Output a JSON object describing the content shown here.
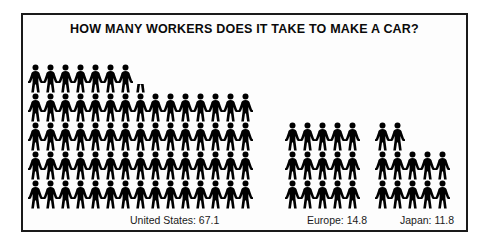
{
  "chart": {
    "title": "HOW MANY WORKERS DOES IT TAKE TO MAKE A CAR?",
    "frame_color": "#1a1a1a",
    "figure_color": "#000000",
    "background": "#ffffff"
  },
  "chart_data": {
    "type": "pictogram",
    "title": "HOW MANY WORKERS DOES IT TAKE TO MAKE A CAR?",
    "xlabel": "",
    "ylabel": "",
    "unit": "1 figure = 1 worker",
    "categories": [
      "United States",
      "Europe",
      "Japan"
    ],
    "values": [
      67.1,
      14.8,
      11.8
    ],
    "value_labels": [
      "67.1",
      "14.8",
      "11.8"
    ],
    "captions": [
      "United States: 67.1",
      "Europe: 14.8",
      "Japan: 11.8"
    ],
    "series": [
      {
        "name": "Workers per car",
        "values": [
          67.1,
          14.8,
          11.8
        ]
      }
    ],
    "groups": [
      {
        "name": "United States",
        "value": 67.1,
        "caption": "United States: 67.1",
        "columns": 15,
        "rows_bottom_to_top": [
          15,
          15,
          15,
          15,
          7.1
        ]
      },
      {
        "name": "Europe",
        "value": 14.8,
        "caption": "Europe: 14.8",
        "columns": 5,
        "rows_bottom_to_top": [
          5,
          5,
          4.8
        ]
      },
      {
        "name": "Japan",
        "value": 11.8,
        "caption": "Japan: 11.8",
        "columns": 5,
        "rows_bottom_to_top": [
          5,
          5,
          1.8
        ]
      }
    ]
  }
}
